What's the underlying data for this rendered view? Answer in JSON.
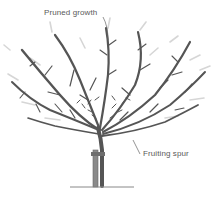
{
  "diagram": {
    "labels": {
      "pruned_growth": "Pruned growth",
      "fruiting_spur": "Fruiting spur"
    },
    "colors": {
      "branch": "#555555",
      "pruned_ghost": "#d4d4d4",
      "stake": "#777777",
      "label_text": "#5a5a5a",
      "leader_line": "#666666",
      "ground": "#888888"
    }
  }
}
